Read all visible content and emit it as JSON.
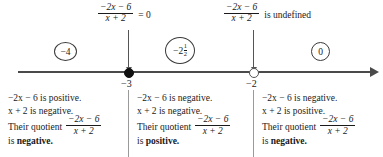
{
  "diagram": {
    "type": "sign-analysis-number-line",
    "expression": {
      "numerator": "−2x − 6",
      "denominator": "x + 2"
    },
    "top_annotations": [
      {
        "name": "zero-annotation",
        "numerator": "−2x − 6",
        "denominator": "x + 2",
        "tail": "= 0",
        "points_to": "−3"
      },
      {
        "name": "undefined-annotation",
        "numerator": "−2x − 6",
        "denominator": "x + 2",
        "tail": "is undefined",
        "points_to": "−2"
      }
    ],
    "number_line": {
      "ticks": [
        {
          "label": "−3",
          "marker": "filled",
          "value": -3
        },
        {
          "label": "−2",
          "marker": "open",
          "value": -2
        }
      ],
      "arrow_right": true
    },
    "test_values": [
      {
        "name": "test-value-left",
        "label": "−4"
      },
      {
        "name": "test-value-mid",
        "whole": "−2",
        "frac_num": "1",
        "frac_den": "2"
      },
      {
        "name": "test-value-right",
        "label": "0"
      }
    ],
    "intervals": [
      {
        "name": "interval-left",
        "numerator_sign_text": "−2x − 6 is positive.",
        "denominator_sign_text": "x + 2 is negative.",
        "quotient_label": "Their quotient",
        "quotient_numerator": "−2x − 6",
        "quotient_denominator": "x + 2",
        "conclusion_prefix": "is ",
        "conclusion": "negative."
      },
      {
        "name": "interval-middle",
        "numerator_sign_text": "−2x − 6 is negative.",
        "denominator_sign_text": "x + 2 is negative.",
        "quotient_label": "Their quotient",
        "quotient_numerator": "−2x − 6",
        "quotient_denominator": "x + 2",
        "conclusion_prefix": "is ",
        "conclusion": "positive."
      },
      {
        "name": "interval-right",
        "numerator_sign_text": "−2x − 6 is negative.",
        "denominator_sign_text": "x + 2 is positive.",
        "quotient_label": "Their quotient",
        "quotient_numerator": "−2x − 6",
        "quotient_denominator": "x + 2",
        "conclusion_prefix": "is ",
        "conclusion": "negative."
      }
    ],
    "colors": {
      "ink": "#1a1a1a",
      "line": "#4a4a4a",
      "pointer": "#555555",
      "divider": "#9a9a9a",
      "background": "#ffffff"
    }
  }
}
